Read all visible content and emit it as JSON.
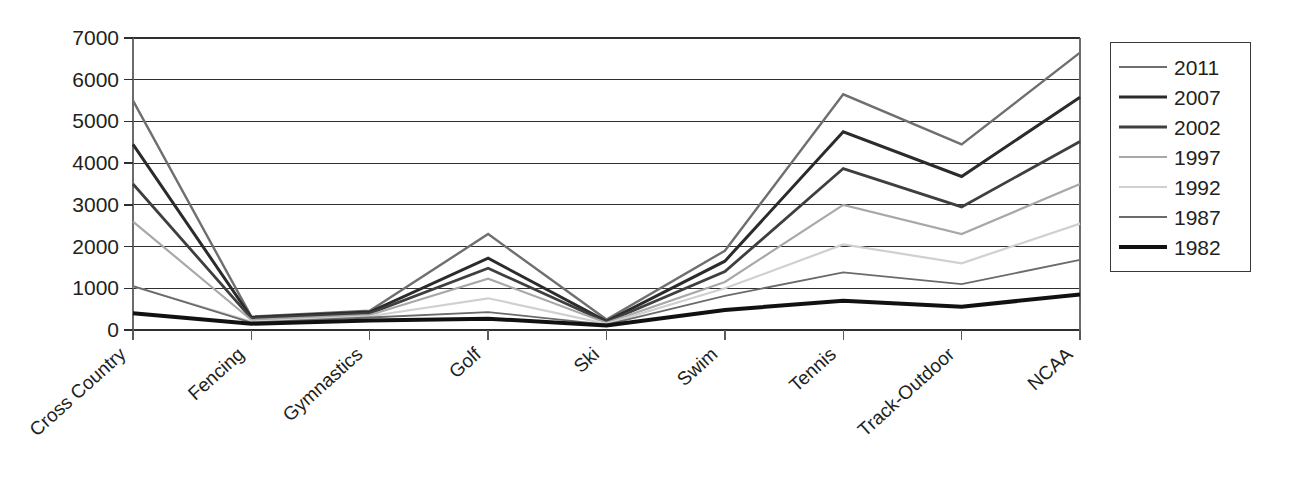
{
  "chart_data": {
    "type": "line",
    "title": "",
    "subtitle": "",
    "xlabel": "",
    "ylabel": "",
    "categories": [
      "Cross Country",
      "Fencing",
      "Gymnastics",
      "Golf",
      "Ski",
      "Swim",
      "Tennis",
      "Track-Outdoor",
      "NCAA"
    ],
    "ylim": [
      0,
      7000
    ],
    "ytick_step": 1000,
    "yticks": [
      "0",
      "1000",
      "2000",
      "3000",
      "4000",
      "5000",
      "6000",
      "7000"
    ],
    "grid": true,
    "legend_position": "right",
    "series": [
      {
        "name": "2011",
        "color": "#6f6f6f",
        "width": 2.4,
        "values": [
          5500,
          320,
          460,
          2300,
          250,
          1900,
          5650,
          4450,
          6650
        ]
      },
      {
        "name": "2007",
        "color": "#2b2b2b",
        "width": 3.0,
        "values": [
          4450,
          300,
          430,
          1720,
          210,
          1650,
          4750,
          3680,
          5580
        ]
      },
      {
        "name": "2002",
        "color": "#3f3f3f",
        "width": 2.8,
        "values": [
          3500,
          280,
          400,
          1480,
          190,
          1400,
          3870,
          2950,
          4520
        ]
      },
      {
        "name": "1997",
        "color": "#a8a8a8",
        "width": 2.2,
        "values": [
          2600,
          240,
          360,
          1230,
          170,
          1150,
          3000,
          2300,
          3500
        ]
      },
      {
        "name": "1992",
        "color": "#d0d0d0",
        "width": 2.2,
        "values": [
          1050,
          200,
          330,
          760,
          150,
          1000,
          2050,
          1600,
          2550
        ]
      },
      {
        "name": "1987",
        "color": "#6a6a6a",
        "width": 1.8,
        "values": [
          1050,
          180,
          300,
          430,
          130,
          820,
          1380,
          1100,
          1680
        ]
      },
      {
        "name": "1982",
        "color": "#111111",
        "width": 4.0,
        "values": [
          400,
          150,
          230,
          270,
          110,
          480,
          700,
          560,
          850
        ]
      }
    ]
  },
  "legend": {
    "entries": [
      "2011",
      "2007",
      "2002",
      "1997",
      "1992",
      "1987",
      "1982"
    ]
  },
  "axes": {
    "y_ticks": [
      "7000",
      "6000",
      "5000",
      "4000",
      "3000",
      "2000",
      "1000",
      "0"
    ],
    "x_ticks": [
      "Cross Country",
      "Fencing",
      "Gymnastics",
      "Golf",
      "Ski",
      "Swim",
      "Tennis",
      "Track-Outdoor",
      "NCAA"
    ]
  }
}
